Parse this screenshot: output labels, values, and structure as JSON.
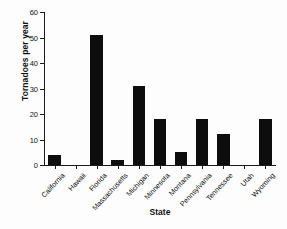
{
  "chart_data": {
    "type": "bar",
    "title": "",
    "xlabel": "State",
    "ylabel": "Tornadoes per year",
    "categories": [
      "California",
      "Hawaii",
      "Florida",
      "Massachusetts",
      "Michigan",
      "Minnesota",
      "Montana",
      "Pennsylvania",
      "Tennessee",
      "Utah",
      "Wyoming"
    ],
    "values": [
      4,
      0,
      51,
      2,
      31,
      18,
      5,
      18,
      12,
      0,
      18
    ],
    "ylim": [
      0,
      60
    ],
    "yticks": [
      0,
      10,
      20,
      30,
      40,
      50,
      60
    ],
    "ytick_labels": [
      "0",
      "10",
      "20",
      "30",
      "40",
      "50",
      "60"
    ],
    "grid": false,
    "legend": "none",
    "bar_color": "#0d0d0d"
  }
}
